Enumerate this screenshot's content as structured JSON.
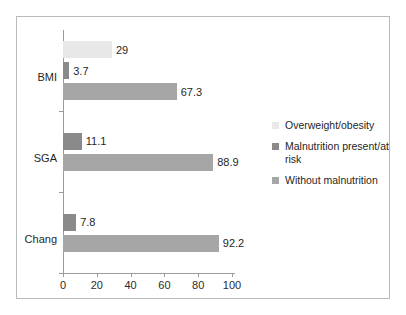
{
  "chart_data": {
    "type": "bar",
    "orientation": "horizontal",
    "title": "",
    "xlabel": "",
    "ylabel": "",
    "xlim": [
      0,
      100
    ],
    "xticks": [
      0,
      20,
      40,
      60,
      80,
      100
    ],
    "xtick_labels": [
      "0",
      "20",
      "40",
      "60",
      "80",
      "100"
    ],
    "grid": false,
    "legend_position": "right",
    "categories": [
      "BMI",
      "SGA",
      "Chang"
    ],
    "series": [
      {
        "name": "Overweight/obesity",
        "color": "#e8e8e8",
        "values": [
          29,
          null,
          null
        ],
        "labels": [
          "29",
          "",
          ""
        ]
      },
      {
        "name": "Malnutrition present/at risk",
        "color": "#8a8a8a",
        "values": [
          3.7,
          11.1,
          7.8
        ],
        "labels": [
          "3.7",
          "11.1",
          "7.8"
        ]
      },
      {
        "name": "Without malnutrition",
        "color": "#a6a6a6",
        "values": [
          67.3,
          88.9,
          92.2
        ],
        "labels": [
          "67.3",
          "88.9",
          "92.2"
        ]
      }
    ],
    "bars": [
      {
        "category": "BMI",
        "series": "Overweight/obesity",
        "value": 29,
        "label": "29",
        "color": "#e8e8e8"
      },
      {
        "category": "BMI",
        "series": "Malnutrition present/at risk",
        "value": 3.7,
        "label": "3.7",
        "color": "#8a8a8a"
      },
      {
        "category": "BMI",
        "series": "Without malnutrition",
        "value": 67.3,
        "label": "67.3",
        "color": "#a6a6a6"
      },
      {
        "category": "SGA",
        "series": "Malnutrition present/at risk",
        "value": 11.1,
        "label": "11.1",
        "color": "#8a8a8a"
      },
      {
        "category": "SGA",
        "series": "Without malnutrition",
        "value": 88.9,
        "label": "88.9",
        "color": "#a6a6a6"
      },
      {
        "category": "Chang",
        "series": "Malnutrition present/at risk",
        "value": 7.8,
        "label": "7.8",
        "color": "#8a8a8a"
      },
      {
        "category": "Chang",
        "series": "Without malnutrition",
        "value": 92.2,
        "label": "92.2",
        "color": "#a6a6a6"
      }
    ]
  },
  "axis": {
    "ticks": [
      {
        "value": 0,
        "label": "0"
      },
      {
        "value": 20,
        "label": "20"
      },
      {
        "value": 40,
        "label": "40"
      },
      {
        "value": 60,
        "label": "60"
      },
      {
        "value": 80,
        "label": "80"
      },
      {
        "value": 100,
        "label": "100"
      }
    ]
  },
  "categories": [
    {
      "label": "BMI"
    },
    {
      "label": "SGA"
    },
    {
      "label": "Chang"
    }
  ],
  "legend": {
    "items": [
      {
        "label": "Overweight/obesity",
        "color": "#e8e8e8"
      },
      {
        "label": "Malnutrition present/at risk",
        "color": "#8a8a8a"
      },
      {
        "label": "Without malnutrition",
        "color": "#a6a6a6"
      }
    ]
  },
  "colors": {
    "overweight": "#e8e8e8",
    "malnutrition": "#8a8a8a",
    "without_malnutrition": "#a6a6a6",
    "axis": "#9b9b9b",
    "frame": "#b9b9b9",
    "text": "#1f1f1f",
    "background": "#ffffff"
  }
}
